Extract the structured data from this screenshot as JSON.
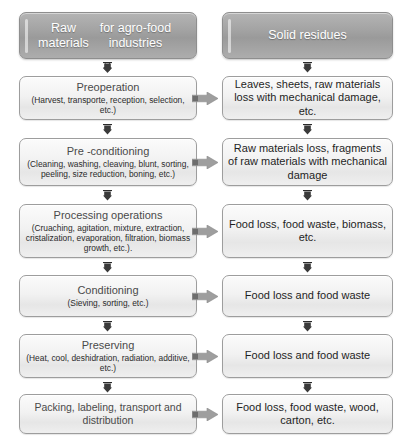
{
  "diagram": {
    "columns": {
      "left_header": "Raw materials\nfor agro-food industries",
      "left_header_line1": "Raw materials",
      "left_header_line2": "for agro-food industries",
      "right_header": "Solid residues"
    },
    "colors": {
      "header_fill": "#a3a3a3",
      "header_text": "#ffffff",
      "box_fill": "#f2f2f2",
      "box_border": "#9d9d9d",
      "arrow_fill": "#9a9a9a",
      "title_text": "#4a4a4a",
      "body_text": "#2b2b2b"
    },
    "rows": [
      {
        "process_title": "Preoperation",
        "process_detail": "(Harvest, transporte, reception, selection, etc.)",
        "residue": "Leaves, sheets, raw materials loss with mechanical damage, etc."
      },
      {
        "process_title": "Pre -conditioning",
        "process_detail": "(Cleaning, washing, cleaving, blunt, sorting, peeling, size reduction, boning, etc.)",
        "residue": "Raw materials loss, fragments of raw materials with mechanical damage"
      },
      {
        "process_title": "Processing operations",
        "process_detail": "(Cruaching, agitation, mixture, extraction, cristalization, evaporation, filtration, biomass growth, etc.).",
        "residue": "Food loss, food waste, biomass, etc."
      },
      {
        "process_title": "Conditioning",
        "process_detail": "(Sieving, sorting, etc.)",
        "residue": "Food loss and food waste"
      },
      {
        "process_title": "Preserving",
        "process_detail": "(Heat, cool, deshidration, radiation, additive, etc.)",
        "residue": "Food loss and food waste"
      },
      {
        "process_title": "Packing, labeling, transport and distribution",
        "process_detail": "",
        "residue": "Food loss, food waste, wood, carton, etc."
      }
    ],
    "icons": {
      "down_arrow": "arrow-down-icon",
      "right_arrow": "arrow-right-icon"
    }
  }
}
